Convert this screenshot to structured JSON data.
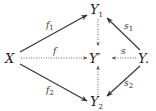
{
  "diagram": {
    "type": "commutative-diagram",
    "nodes": {
      "X": {
        "label": "X"
      },
      "Y1": {
        "label": "Y",
        "sub": "1"
      },
      "Yprime": {
        "label": "Y′"
      },
      "Y2": {
        "label": "Y",
        "sub": "2"
      },
      "Y": {
        "label": "Y."
      }
    },
    "edges": [
      {
        "from": "X",
        "to": "Y1",
        "label": "f",
        "sub": "1",
        "style": "solid"
      },
      {
        "from": "X",
        "to": "Yprime",
        "label": "f",
        "sub": "",
        "style": "dotted"
      },
      {
        "from": "X",
        "to": "Y2",
        "label": "f",
        "sub": "2",
        "style": "solid"
      },
      {
        "from": "Y",
        "to": "Y1",
        "label": "s",
        "sub": "1",
        "style": "solid"
      },
      {
        "from": "Y",
        "to": "Yprime",
        "label": "s",
        "sub": "",
        "style": "dotted"
      },
      {
        "from": "Y",
        "to": "Y2",
        "label": "s",
        "sub": "2",
        "style": "solid"
      },
      {
        "from": "Y1",
        "to": "Yprime",
        "label": "",
        "style": "dotted"
      },
      {
        "from": "Y2",
        "to": "Yprime",
        "label": "",
        "style": "dotted"
      }
    ]
  }
}
